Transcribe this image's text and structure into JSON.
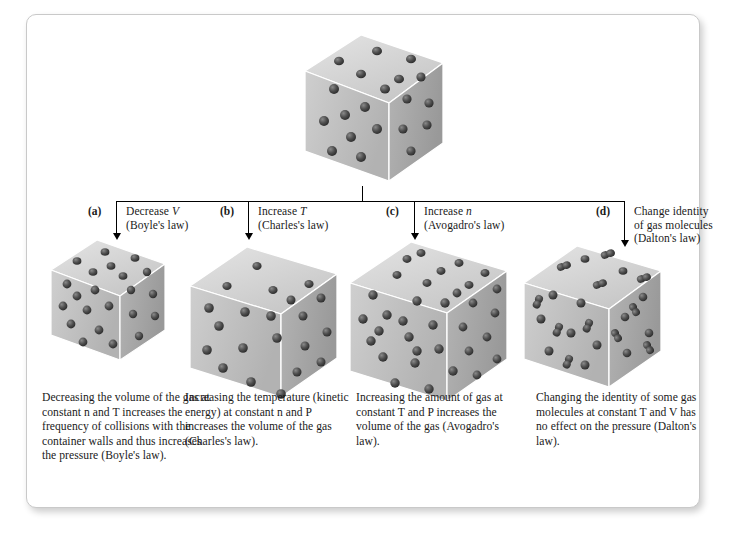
{
  "figure": {
    "top_container": {
      "name": "initial-gas-sample",
      "molecule_count": 20,
      "molecule_type": "sphere"
    },
    "branches": [
      {
        "tag": "(a)",
        "action_line1": "Decrease ",
        "action_var": "V",
        "action_line2": "(Boyle's law)",
        "law": "Boyle's law",
        "cube": {
          "molecule_count": 22,
          "molecule_type": "sphere",
          "relative_size": "small"
        },
        "caption": "Decreasing the volume of the gas at constant n and T increases the frequency of collisions with the container walls and thus increases the pressure (Boyle's law)."
      },
      {
        "tag": "(b)",
        "action_line1": "Increase ",
        "action_var": "T",
        "action_line2": "(Charles's law)",
        "law": "Charles's law",
        "cube": {
          "molecule_count": 21,
          "molecule_type": "sphere",
          "relative_size": "large"
        },
        "caption": "Increasing the temperature (kinetic energy) at constant n and P increases the volume of the gas (Charles's law)."
      },
      {
        "tag": "(c)",
        "action_line1": "Increase ",
        "action_var": "n",
        "action_line2": "(Avogadro's law)",
        "law": "Avogadro's law",
        "cube": {
          "molecule_count": 34,
          "molecule_type": "sphere",
          "relative_size": "large"
        },
        "caption": "Increasing the amount of gas at constant T and P increases the volume of the gas (Avogadro's law)."
      },
      {
        "tag": "(d)",
        "action_line1": "Change identity",
        "action_line1b": "of gas molecules",
        "action_line2": "(Dalton's law)",
        "law": "Dalton's law",
        "cube": {
          "molecule_count": 24,
          "molecule_type": "mixed-sphere-and-diatomic",
          "relative_size": "medium"
        },
        "caption": "Changing the identity of some gas molecules at constant T and V has no effect on the pressure (Dalton's law)."
      }
    ],
    "colors": {
      "page_background": "#ffffff",
      "frame_border": "#c9c9c9",
      "text": "#1a1a1a",
      "connector_line": "#000000",
      "cube_top_face": "#d8d8d8",
      "cube_left_face": "#bdbdbd",
      "cube_right_face": "#a9a9a9",
      "molecule": "#4a4a4a"
    }
  }
}
